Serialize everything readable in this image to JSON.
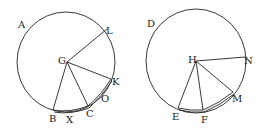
{
  "figures": [
    {
      "name": "left-circle",
      "center_label": "G",
      "labels": {
        "A": "A",
        "L": "L",
        "G": "G",
        "K": "K",
        "O": "O",
        "C": "C",
        "X": "X",
        "B": "B"
      }
    },
    {
      "name": "right-circle",
      "center_label": "H",
      "labels": {
        "D": "D",
        "H": "H",
        "N": "N",
        "M": "M",
        "F": "F",
        "E": "E"
      }
    }
  ]
}
